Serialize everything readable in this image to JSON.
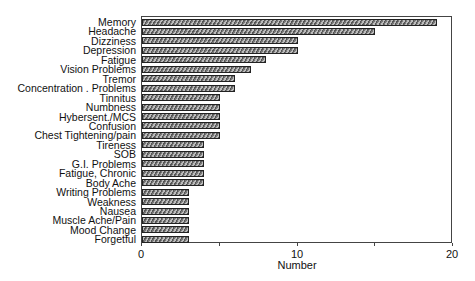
{
  "chart_data": {
    "type": "bar",
    "orientation": "horizontal",
    "title": "",
    "xlabel": "Number",
    "ylabel": "",
    "xlim": [
      0,
      20
    ],
    "xticks": [
      0,
      10,
      20
    ],
    "minor_xticks": [
      5,
      15
    ],
    "grid": false,
    "legend": null,
    "categories": [
      "Memory",
      "Headache",
      "Dizziness",
      "Depression",
      "Fatigue",
      "Vision Problems",
      "Tremor",
      "Concentration . Problems",
      "Tinnitus",
      "Numbness",
      "Hybersent./MCS",
      "Confusion",
      "Chest Tightening/pain",
      "Tireness",
      "SOB",
      "G.I. Problems",
      "Fatigue, Chronic",
      "Body Ache",
      "Writing Problems",
      "Weakness",
      "Nausea",
      "Muscle Ache/Pain",
      "Mood Change",
      "Forgetful"
    ],
    "values": [
      19,
      15,
      10,
      10,
      8,
      7,
      6,
      6,
      5,
      5,
      5,
      5,
      5,
      4,
      4,
      4,
      4,
      4,
      3,
      3,
      3,
      3,
      3,
      3
    ]
  },
  "axis": {
    "tick_labels": [
      "0",
      "10",
      "20"
    ],
    "title": "Number"
  }
}
